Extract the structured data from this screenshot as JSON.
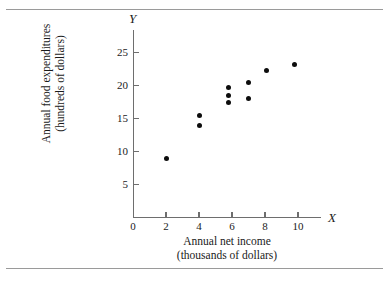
{
  "figure": {
    "axis_x_symbol": "X",
    "axis_y_symbol": "Y",
    "xlabel_line1": "Annual net income",
    "xlabel_line2": "(thousands of dollars)",
    "ylabel_line1": "Annual food expenditures",
    "ylabel_line2": "(hundreds of dollars)",
    "origin_label": "0"
  },
  "chart_data": {
    "type": "scatter",
    "title": "",
    "xlabel": "Annual net income (thousands of dollars)",
    "ylabel": "Annual food expenditures (hundreds of dollars)",
    "xlim": [
      0,
      11.4
    ],
    "ylim": [
      0,
      28.5
    ],
    "grid": false,
    "legend": null,
    "xticks": [
      0,
      2,
      4,
      6,
      8,
      10
    ],
    "xtick_labels": [
      "0",
      "2",
      "4",
      "6",
      "8",
      "10"
    ],
    "yticks": [
      5,
      10,
      15,
      20,
      25
    ],
    "ytick_labels": [
      "5",
      "10",
      "15",
      "20",
      "25"
    ],
    "marker": "filled-circle",
    "marker_color": "#0d0d0d",
    "points": [
      {
        "x": 2.0,
        "y": 9.0
      },
      {
        "x": 4.0,
        "y": 15.5
      },
      {
        "x": 4.0,
        "y": 14.0
      },
      {
        "x": 5.8,
        "y": 19.7
      },
      {
        "x": 5.8,
        "y": 18.5
      },
      {
        "x": 5.8,
        "y": 17.5
      },
      {
        "x": 7.0,
        "y": 20.5
      },
      {
        "x": 7.0,
        "y": 18.0
      },
      {
        "x": 8.1,
        "y": 22.2
      },
      {
        "x": 9.8,
        "y": 23.2
      }
    ]
  }
}
